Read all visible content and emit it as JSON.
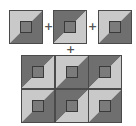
{
  "diagram": {
    "title": "",
    "colors": {
      "light": "#c9c9c9",
      "dark": "#6f6f6f",
      "center_fill": "#7b7b7b",
      "center_border": "#3a3a3a",
      "outline": "#4a4a4a",
      "plus": "#555555"
    },
    "operators": [
      "+",
      "+",
      "+"
    ],
    "top_row": [
      {
        "id": "tile-a",
        "top_left": "light",
        "bottom_right": "dark"
      },
      {
        "id": "tile-b",
        "top_left": "dark",
        "bottom_right": "light"
      },
      {
        "id": "tile-c",
        "top_left": "light",
        "bottom_right": "dark"
      }
    ],
    "grid": {
      "rows": 2,
      "cols": 3,
      "cells": [
        [
          {
            "top_left": "dark",
            "bottom_right": "light"
          },
          {
            "top_left": "light",
            "bottom_right": "dark"
          },
          {
            "top_left": "dark",
            "bottom_right": "light"
          }
        ],
        [
          {
            "top_left": "light",
            "bottom_right": "dark"
          },
          {
            "top_left": "dark",
            "bottom_right": "light"
          },
          {
            "top_left": "light",
            "bottom_right": "dark"
          }
        ]
      ]
    }
  }
}
